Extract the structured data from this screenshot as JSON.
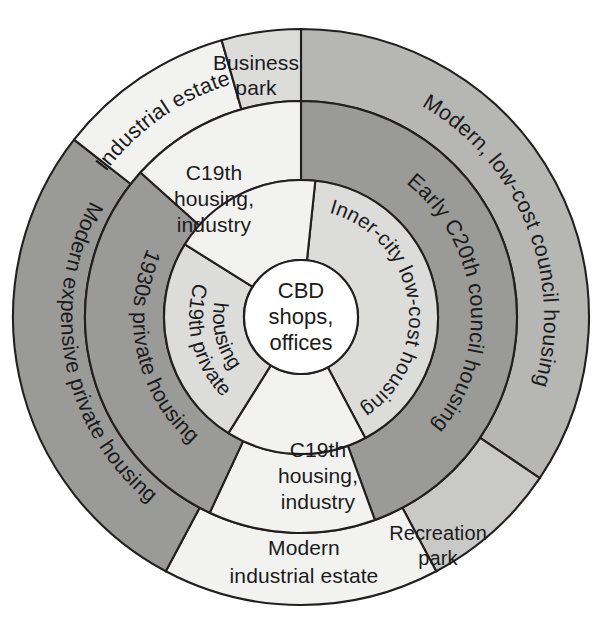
{
  "figure": {
    "kind": "concentric-urban-land-use-model",
    "background_color": "#ffffff",
    "outline_color": "#231f20",
    "center_x": 301,
    "center_y": 317,
    "ring_radii": [
      57,
      137,
      216,
      288
    ],
    "palette": {
      "white": "#ffffff",
      "very_light_gray": "#f2f2f1",
      "light_gray": "#dcdcdb",
      "mid_light_gray": "#c9c9c8",
      "mid_gray": "#b6b6b5",
      "dark_gray": "#9a9a99",
      "darker_gray": "#8e8e8d"
    }
  },
  "core": {
    "name": "central-business-district",
    "lines": [
      "CBD",
      "shops,",
      "offices"
    ],
    "line1": "CBD",
    "line2": "shops,",
    "line3": "offices",
    "fill": "#ffffff"
  },
  "zones": {
    "inner_city_low_cost_housing": {
      "label": "Inner-city low-cost housing",
      "ring": 2,
      "fill": "#dcdcdb",
      "start_angle": 6,
      "end_angle": 152
    },
    "c19th_housing_industry_south": {
      "label_line1": "C19th",
      "label_line2": "housing,",
      "label_line3": "industry",
      "label": "C19th housing, industry",
      "ring": 2,
      "fill": "#f2f2f1",
      "start_angle": 152,
      "end_angle": 212
    },
    "c19th_private_housing": {
      "label_line1": "C19th private",
      "label_line2": "housing",
      "label": "C19th private housing",
      "ring": 2,
      "fill": "#dcdcdb",
      "start_angle": 212,
      "end_angle": 302
    },
    "c19th_housing_industry_north": {
      "label_line1": "C19th",
      "label_line2": "housing,",
      "label_line3": "industry",
      "label": "C19th housing, industry",
      "ring": 2,
      "fill": "#f2f2f1",
      "start_angle": 302,
      "end_angle": 366
    },
    "early_c20th_council_housing": {
      "label": "Early C20th council housing",
      "ring": 3,
      "fill": "#9a9a99",
      "start_angle": 0,
      "end_angle": 160
    },
    "c19th_housing_industry_ring3_south": {
      "label": "C19th housing, industry",
      "ring": 3,
      "fill": "#f2f2f1",
      "start_angle": 160,
      "end_angle": 205
    },
    "modern_1930s_private_housing": {
      "label": "1930s private housing",
      "ring": 3,
      "fill": "#9a9a99",
      "start_angle": 205,
      "end_angle": 312
    },
    "c19th_housing_industry_ring3_north": {
      "label": "C19th housing, industry",
      "ring": 3,
      "fill": "#f2f2f1",
      "start_angle": 312,
      "end_angle": 360
    },
    "modern_low_cost_council_housing": {
      "label": "Modern, low-cost council housing",
      "ring": 4,
      "fill": "#b6b6b5",
      "start_angle": 0,
      "end_angle": 124
    },
    "recreation_park": {
      "label_line1": "Recreation",
      "label_line2": "park",
      "label": "Recreation park",
      "ring": 4,
      "fill": "#c9c9c8",
      "start_angle": 124,
      "end_angle": 152
    },
    "modern_industrial_estate": {
      "label_line1": "Modern",
      "label_line2": "industrial estate",
      "label": "Modern industrial estate",
      "ring": 4,
      "fill": "#f2f2f1",
      "start_angle": 152,
      "end_angle": 208
    },
    "modern_expensive_private_housing": {
      "label": "Modern expensive private housing",
      "ring": 4,
      "fill": "#9a9a99",
      "start_angle": 208,
      "end_angle": 308
    },
    "industrial_estate": {
      "label": "Industrial estate",
      "ring": 4,
      "fill": "#f2f2f1",
      "start_angle": 308,
      "end_angle": 344
    },
    "business_park": {
      "label_line1": "Business",
      "label_line2": "park",
      "label": "Business park",
      "ring": 4,
      "fill": "#dcdcdb",
      "start_angle": 344,
      "end_angle": 360
    }
  }
}
